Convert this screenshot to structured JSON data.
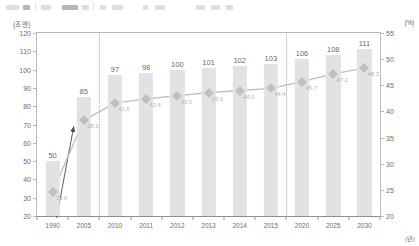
{
  "toolbar": {
    "name": "cropped-application-toolbar"
  },
  "chart_data": {
    "type": "bar",
    "title": "",
    "subtitle": "",
    "xlabel": "(년)",
    "ylabel": "(조 엔)",
    "ylabel_right": "(%)",
    "categories": [
      "1990",
      "2005",
      "2010",
      "2011",
      "2012",
      "2013",
      "2014",
      "2015",
      "2020",
      "2025",
      "2030"
    ],
    "ylim": [
      20,
      120
    ],
    "ylim_right": [
      20,
      55
    ],
    "yticks": [
      20,
      30,
      40,
      50,
      60,
      70,
      80,
      90,
      100,
      110,
      120
    ],
    "yticks_right": [
      20,
      25,
      30,
      35,
      40,
      45,
      50,
      55
    ],
    "grid": false,
    "legend": "none",
    "series": [
      {
        "name": "막대",
        "type": "bar",
        "axis": "left",
        "color": "#e2e2e4",
        "values": [
          50,
          85,
          97,
          98,
          100,
          101,
          102,
          103,
          106,
          108,
          111
        ],
        "labels": [
          "50",
          "85",
          "97",
          "98",
          "100",
          "101",
          "102",
          "103",
          "106",
          "108",
          "111"
        ]
      },
      {
        "name": "선",
        "type": "line",
        "axis": "right",
        "color": "#bfbfc3",
        "values": [
          24.6,
          38.3,
          41.6,
          42.4,
          43.0,
          43.6,
          44.0,
          44.4,
          45.7,
          47.2,
          48.3
        ],
        "labels": [
          "24.6",
          "38.3",
          "41.6",
          "42.4",
          "43.0",
          "43.6",
          "44.0",
          "44.4",
          "45.7",
          "47.2",
          "48.3"
        ]
      }
    ],
    "dividers": [
      "2005|2010",
      "2015|2020"
    ],
    "annotations": [
      {
        "name": "growth-arrow",
        "from": "1990",
        "to": "2005"
      }
    ]
  }
}
